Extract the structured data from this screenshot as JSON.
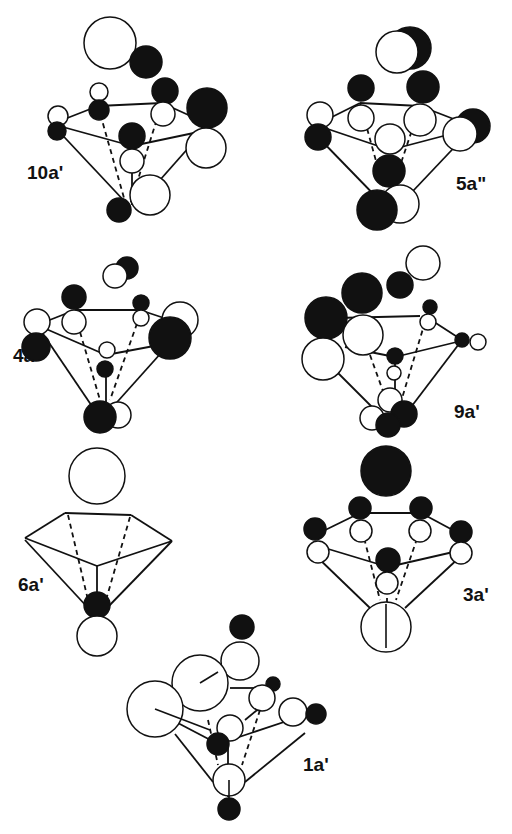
{
  "figure": {
    "colors": {
      "phase_positive": "#ffffff",
      "phase_negative": "#111111",
      "stroke": "#111111",
      "background": "#ffffff"
    }
  },
  "panels": [
    {
      "id": "10a-prime",
      "label": "10a'",
      "label_pos": [
        27,
        173
      ],
      "lines": [
        [
          52,
          124,
          98,
          106
        ],
        [
          98,
          106,
          162,
          103
        ],
        [
          162,
          103,
          206,
          123
        ],
        [
          52,
          124,
          132,
          146
        ],
        [
          132,
          146,
          208,
          130
        ],
        [
          52,
          124,
          128,
          205
        ],
        [
          206,
          128,
          160,
          180
        ],
        [
          132,
          146,
          132,
          205
        ]
      ],
      "dashed": [
        [
          98,
          106,
          126,
          205
        ],
        [
          162,
          103,
          130,
          205
        ]
      ],
      "orbitals": [
        [
          110,
          43,
          26,
          "w"
        ],
        [
          146,
          62,
          16,
          "b"
        ],
        [
          165,
          91,
          13,
          "b"
        ],
        [
          207,
          108,
          20,
          "b"
        ],
        [
          99,
          92,
          9,
          "w"
        ],
        [
          58,
          116,
          10,
          "w"
        ],
        [
          99,
          110,
          10,
          "b"
        ],
        [
          57,
          131,
          9,
          "b"
        ],
        [
          163,
          114,
          12,
          "w"
        ],
        [
          132,
          136,
          13,
          "b"
        ],
        [
          132,
          161,
          12,
          "w"
        ],
        [
          206,
          148,
          20,
          "w"
        ],
        [
          150,
          195,
          20,
          "w"
        ],
        [
          119,
          210,
          12,
          "b"
        ]
      ]
    },
    {
      "id": "5a-double-prime",
      "label": "5a\"",
      "label_pos": [
        456,
        184
      ],
      "lines": [
        [
          316,
          125,
          360,
          103
        ],
        [
          360,
          103,
          420,
          106
        ],
        [
          420,
          106,
          464,
          123
        ],
        [
          316,
          125,
          390,
          150
        ],
        [
          390,
          150,
          466,
          130
        ],
        [
          316,
          135,
          384,
          205
        ],
        [
          466,
          135,
          395,
          210
        ]
      ],
      "dashed": [
        [
          360,
          103,
          384,
          190
        ],
        [
          420,
          106,
          392,
          190
        ]
      ],
      "orbitals": [
        [
          410,
          48,
          21,
          "b"
        ],
        [
          397,
          52,
          21,
          "w"
        ],
        [
          361,
          88,
          13,
          "b"
        ],
        [
          423,
          87,
          16,
          "b"
        ],
        [
          320,
          115,
          13,
          "w"
        ],
        [
          361,
          118,
          13,
          "w"
        ],
        [
          420,
          120,
          16,
          "w"
        ],
        [
          473,
          126,
          17,
          "b"
        ],
        [
          460,
          134,
          17,
          "w"
        ],
        [
          318,
          137,
          13,
          "b"
        ],
        [
          390,
          139,
          15,
          "w"
        ],
        [
          389,
          171,
          16,
          "b"
        ],
        [
          400,
          204,
          19,
          "w"
        ],
        [
          377,
          210,
          20,
          "b"
        ]
      ]
    },
    {
      "id": "4a-double-prime",
      "label": "4a\"",
      "label_pos": [
        13,
        356
      ],
      "lines": [
        [
          37,
          325,
          75,
          310
        ],
        [
          75,
          310,
          140,
          310
        ],
        [
          140,
          310,
          170,
          320
        ],
        [
          37,
          325,
          106,
          355
        ],
        [
          106,
          355,
          170,
          343
        ],
        [
          37,
          325,
          100,
          418
        ],
        [
          170,
          343,
          110,
          410
        ],
        [
          106,
          362,
          106,
          405
        ]
      ],
      "dashed": [
        [
          75,
          315,
          100,
          400
        ],
        [
          140,
          315,
          110,
          400
        ]
      ],
      "orbitals": [
        [
          127,
          268,
          11,
          "b"
        ],
        [
          115,
          276,
          12,
          "w"
        ],
        [
          74,
          297,
          12,
          "b"
        ],
        [
          141,
          303,
          8,
          "b"
        ],
        [
          180,
          320,
          18,
          "w"
        ],
        [
          37,
          322,
          13,
          "w"
        ],
        [
          74,
          322,
          12,
          "w"
        ],
        [
          141,
          318,
          8,
          "w"
        ],
        [
          170,
          338,
          21,
          "b"
        ],
        [
          36,
          347,
          14,
          "b"
        ],
        [
          107,
          350,
          8,
          "w"
        ],
        [
          105,
          369,
          8,
          "b"
        ],
        [
          118,
          415,
          13,
          "w"
        ],
        [
          100,
          417,
          16,
          "b"
        ]
      ]
    },
    {
      "id": "9a-prime",
      "label": "9a'",
      "label_pos": [
        454,
        412
      ],
      "lines": [
        [
          336,
          318,
          420,
          316
        ],
        [
          428,
          318,
          462,
          340
        ],
        [
          345,
          347,
          395,
          357
        ],
        [
          395,
          357,
          465,
          340
        ],
        [
          335,
          370,
          385,
          420
        ],
        [
          462,
          340,
          405,
          415
        ],
        [
          395,
          360,
          395,
          410
        ]
      ],
      "dashed": [
        [
          370,
          355,
          388,
          405
        ],
        [
          425,
          322,
          400,
          405
        ]
      ],
      "orbitals": [
        [
          423,
          263,
          17,
          "w"
        ],
        [
          400,
          285,
          13,
          "b"
        ],
        [
          362,
          293,
          20,
          "b"
        ],
        [
          326,
          318,
          21,
          "b"
        ],
        [
          363,
          335,
          20,
          "w"
        ],
        [
          430,
          307,
          7,
          "b"
        ],
        [
          428,
          322,
          8,
          "w"
        ],
        [
          462,
          340,
          7,
          "b"
        ],
        [
          478,
          342,
          8,
          "w"
        ],
        [
          323,
          359,
          21,
          "w"
        ],
        [
          395,
          356,
          8,
          "b"
        ],
        [
          394,
          373,
          7,
          "w"
        ],
        [
          390,
          400,
          12,
          "w"
        ],
        [
          372,
          418,
          12,
          "w"
        ],
        [
          404,
          414,
          13,
          "b"
        ],
        [
          388,
          425,
          12,
          "b"
        ]
      ]
    },
    {
      "id": "6a-prime",
      "label": "6a'",
      "label_pos": [
        18,
        585
      ],
      "lines": [
        [
          25,
          538,
          65,
          513
        ],
        [
          65,
          513,
          131,
          515
        ],
        [
          131,
          515,
          172,
          541
        ],
        [
          25,
          538,
          97,
          566
        ],
        [
          97,
          566,
          172,
          541
        ],
        [
          25,
          540,
          90,
          610
        ],
        [
          172,
          541,
          105,
          610
        ],
        [
          97,
          566,
          97,
          600
        ]
      ],
      "dashed": [
        [
          68,
          515,
          88,
          600
        ],
        [
          130,
          517,
          106,
          600
        ]
      ],
      "orbitals": [
        [
          97,
          476,
          28,
          "w"
        ],
        [
          97,
          605,
          13,
          "b"
        ],
        [
          97,
          636,
          20,
          "w"
        ]
      ]
    },
    {
      "id": "3a-prime",
      "label": "3a'",
      "label_pos": [
        463,
        595
      ],
      "lines": [
        [
          315,
          535,
          360,
          513
        ],
        [
          360,
          513,
          421,
          513
        ],
        [
          421,
          513,
          462,
          535
        ],
        [
          315,
          545,
          388,
          567
        ],
        [
          388,
          567,
          462,
          550
        ],
        [
          315,
          555,
          370,
          608
        ],
        [
          462,
          555,
          405,
          608
        ],
        [
          387,
          598,
          387,
          630
        ]
      ],
      "dashed": [
        [
          362,
          530,
          380,
          600
        ],
        [
          420,
          530,
          396,
          600
        ]
      ],
      "orbitals": [
        [
          386,
          471,
          25,
          "b"
        ],
        [
          360,
          508,
          11,
          "b"
        ],
        [
          421,
          508,
          11,
          "b"
        ],
        [
          315,
          529,
          11,
          "b"
        ],
        [
          461,
          532,
          11,
          "b"
        ],
        [
          361,
          531,
          11,
          "w"
        ],
        [
          420,
          531,
          11,
          "w"
        ],
        [
          318,
          552,
          11,
          "w"
        ],
        [
          461,
          553,
          11,
          "w"
        ],
        [
          388,
          560,
          12,
          "b"
        ],
        [
          387,
          583,
          11,
          "w"
        ],
        [
          386,
          627,
          25,
          "w"
        ]
      ]
    },
    {
      "id": "1a-prime",
      "label": "1a'",
      "label_pos": [
        303,
        765
      ],
      "lines": [
        [
          230,
          688,
          261,
          688
        ],
        [
          155,
          711,
          218,
          744
        ],
        [
          218,
          744,
          305,
          715
        ],
        [
          175,
          734,
          213,
          782
        ],
        [
          305,
          733,
          245,
          782
        ],
        [
          228,
          744,
          228,
          797
        ],
        [
          180,
          690,
          195,
          684
        ],
        [
          245,
          720,
          262,
          706
        ]
      ],
      "dashed": [
        [
          208,
          720,
          218,
          765
        ],
        [
          260,
          710,
          242,
          765
        ]
      ],
      "orbitals": [
        [
          242,
          627,
          12,
          "b"
        ],
        [
          240,
          661,
          19,
          "w"
        ],
        [
          200,
          683,
          28,
          "w"
        ],
        [
          155,
          709,
          28,
          "w"
        ],
        [
          273,
          684,
          7,
          "b"
        ],
        [
          262,
          698,
          13,
          "w"
        ],
        [
          293,
          712,
          14,
          "w"
        ],
        [
          316,
          714,
          10,
          "b"
        ],
        [
          230,
          728,
          13,
          "w"
        ],
        [
          218,
          744,
          11,
          "b"
        ],
        [
          229,
          780,
          16,
          "w"
        ],
        [
          229,
          809,
          11,
          "b"
        ]
      ]
    }
  ]
}
